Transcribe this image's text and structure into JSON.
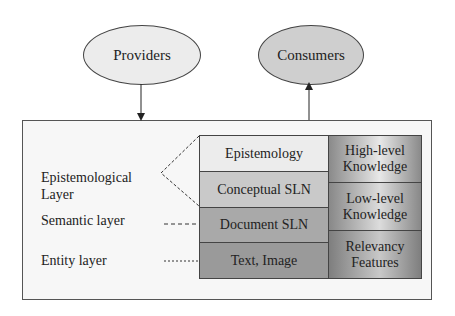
{
  "nodes": {
    "providers": "Providers",
    "consumers": "Consumers"
  },
  "layers_left": [
    {
      "label": "Epistemology",
      "color": "#ececec"
    },
    {
      "label": "Conceptual SLN",
      "color": "#c9c9c9"
    },
    {
      "label": "Document SLN",
      "color": "#a9a9a9"
    },
    {
      "label": "Text, Image",
      "color": "#9a9a9a"
    }
  ],
  "layers_right": [
    {
      "label_line1": "High-level",
      "label_line2": "Knowledge"
    },
    {
      "label_line1": "Low-level",
      "label_line2": "Knowledge"
    },
    {
      "label_line1": "Relevancy",
      "label_line2": "Features"
    }
  ],
  "side_labels": {
    "epistemological_line1": "Epistemological",
    "epistemological_line2": "Layer",
    "semantic": "Semantic layer",
    "entity": "Entity layer"
  }
}
